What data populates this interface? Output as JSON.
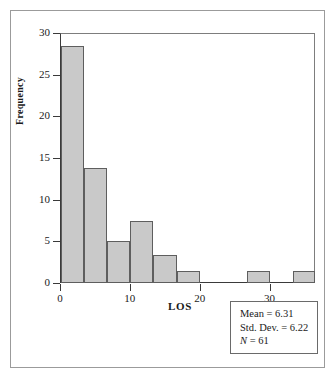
{
  "chart_data": {
    "type": "bar",
    "title": "",
    "subtitle": "",
    "xlabel": "LOS",
    "ylabel": "Frequency",
    "xlim": [
      0,
      36.5
    ],
    "ylim": [
      0,
      30
    ],
    "grid": false,
    "legend_position": "bottom-right",
    "bin_width": 3.33,
    "x_ticks": [
      "0",
      "10",
      "20",
      "30"
    ],
    "x_tick_values": [
      0,
      10,
      20,
      30
    ],
    "y_ticks": [
      "0",
      "5",
      "10",
      "15",
      "20",
      "25",
      "30"
    ],
    "y_tick_values": [
      0,
      5,
      10,
      15,
      20,
      25,
      30
    ],
    "bars": [
      {
        "label": "0.0-3.3",
        "x_start": 0.2,
        "x_end": 3.4,
        "value": 28.5
      },
      {
        "label": "3.3-6.7",
        "x_start": 3.4,
        "x_end": 6.7,
        "value": 13.8
      },
      {
        "label": "6.7-10.0",
        "x_start": 6.7,
        "x_end": 10.0,
        "value": 5.0
      },
      {
        "label": "10.0-13.3",
        "x_start": 10.0,
        "x_end": 13.3,
        "value": 7.4
      },
      {
        "label": "13.3-16.7",
        "x_start": 13.3,
        "x_end": 16.7,
        "value": 3.4
      },
      {
        "label": "16.7-20.0",
        "x_start": 16.7,
        "x_end": 20.0,
        "value": 1.5
      },
      {
        "label": "26.7-30.0",
        "x_start": 26.7,
        "x_end": 30.0,
        "value": 1.5
      },
      {
        "label": "33.3-36.5",
        "x_start": 33.4,
        "x_end": 36.5,
        "value": 1.5
      }
    ],
    "annotations": {
      "mean": "Mean = 6.31",
      "std_dev": "Std. Dev. = 6.22",
      "n_symbol": "N",
      "n_value": " = 61"
    },
    "colors": {
      "bar_fill": "#c9c9c9",
      "bar_stroke": "#5e5e5e",
      "axis": "#3a3a3a",
      "frame": "#9b9b9b",
      "text": "#1a1a1a",
      "background": "#ffffff"
    }
  }
}
